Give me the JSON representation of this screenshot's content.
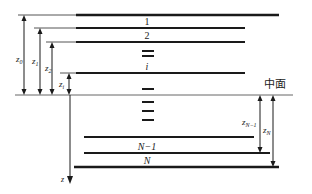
{
  "diagram": {
    "midplane_label": "中面",
    "axis_label": "z",
    "ply_labels": {
      "ply1": "1",
      "ply2": "2",
      "plyi": "i",
      "plyN1": "N−1",
      "plyN": "N"
    },
    "dimension_labels": {
      "z0": "z",
      "z0_sub": "0",
      "z1": "z",
      "z1_sub": "1",
      "z2": "z",
      "z2_sub": "2",
      "zi": "z",
      "zi_sub": "i",
      "zN1": "z",
      "zN1_sub": "N−1",
      "zN": "z",
      "zN_sub": "N"
    },
    "colors": {
      "line": "#1a1a1a",
      "thin_line": "#555555",
      "text": "#222222"
    }
  }
}
